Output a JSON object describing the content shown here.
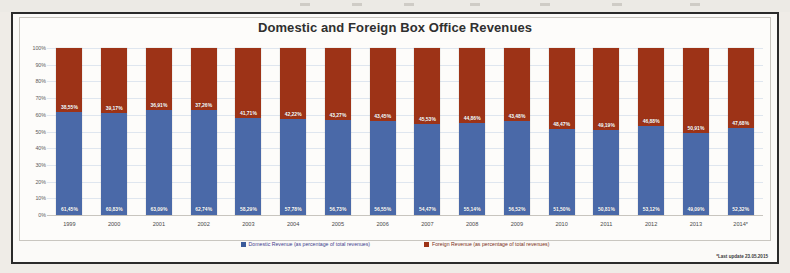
{
  "chart_data": {
    "type": "bar",
    "subtype": "stacked-100-percent",
    "title": "Domestic and Foreign Box Office Revenues",
    "xlabel": "",
    "ylabel": "",
    "ylim": [
      0,
      100
    ],
    "grid": true,
    "legend_position": "bottom",
    "categories": [
      "1999",
      "2000",
      "2001",
      "2002",
      "2003",
      "2004",
      "2005",
      "2006",
      "2007",
      "2008",
      "2009",
      "2010",
      "2011",
      "2012",
      "2013",
      "2014*"
    ],
    "ytick_labels": [
      "100%",
      "90%",
      "80%",
      "70%",
      "60%",
      "50%",
      "40%",
      "30%",
      "20%",
      "10%",
      "0%"
    ],
    "ytick_values": [
      100,
      90,
      80,
      70,
      60,
      50,
      40,
      30,
      20,
      10,
      0
    ],
    "series": [
      {
        "name": "Domestic Revenue (as percentage of total revenues)",
        "color": "#4a69a8",
        "values": [
          61.45,
          60.83,
          63.09,
          62.74,
          58.29,
          57.78,
          56.73,
          56.55,
          54.47,
          55.14,
          56.52,
          51.5,
          50.81,
          53.12,
          49.09,
          52.32
        ],
        "labels": [
          "61,45%",
          "60,83%",
          "63,09%",
          "62,74%",
          "58,29%",
          "57,78%",
          "56,73%",
          "56,55%",
          "54,47%",
          "55,14%",
          "56,52%",
          "51,50%",
          "50,81%",
          "53,12%",
          "49,09%",
          "52,32%"
        ]
      },
      {
        "name": "Foreign Revenue (as percentage of total revenues)",
        "color": "#9d3317",
        "values": [
          38.55,
          39.17,
          36.91,
          37.26,
          41.71,
          42.22,
          43.27,
          43.45,
          45.53,
          44.86,
          43.48,
          48.47,
          49.19,
          46.88,
          50.91,
          47.68
        ],
        "labels": [
          "38,55%",
          "39,17%",
          "36,91%",
          "37,26%",
          "41,71%",
          "42,22%",
          "43,27%",
          "43,45%",
          "45,53%",
          "44,86%",
          "43,48%",
          "48,47%",
          "49,19%",
          "46,88%",
          "50,91%",
          "47,68%"
        ]
      }
    ],
    "footnote": "*Last update 23.05.2015"
  }
}
